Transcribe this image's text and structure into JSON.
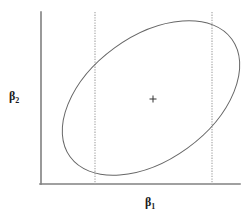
{
  "figure": {
    "title": "",
    "background_color": "#ffffff"
  },
  "axes": {
    "x": {
      "label_symbol": "β",
      "label_subscript": "1",
      "label_text": "β1",
      "line_color": "#808080",
      "pixel_start_x": 41,
      "pixel_end_x": 240,
      "pixel_y": 184
    },
    "y": {
      "label_symbol": "β",
      "label_subscript": "2",
      "label_text": "β2",
      "line_color": "#808080",
      "pixel_x": 41,
      "pixel_start_y": 12,
      "pixel_end_y": 184
    }
  },
  "chart_data": {
    "type": "scatter",
    "title": "",
    "xlabel": "β1",
    "ylabel": "β2",
    "grid": false,
    "legend": null,
    "xlim": [
      41,
      240
    ],
    "ylim": [
      12,
      184
    ],
    "xticks": [],
    "yticks": [],
    "annotations": [],
    "series": [
      {
        "name": "joint-confidence-ellipse",
        "type": "ellipse",
        "stroke_color": "#666666",
        "stroke_width": 1,
        "fill": "none",
        "center_x": 151,
        "center_y": 98,
        "semi_major": 100,
        "semi_minor": 62,
        "rotation_deg": -36,
        "extent_left_x": 72,
        "extent_right_x": 228,
        "extent_top_y": 14,
        "extent_bottom_y": 181
      },
      {
        "name": "center-point-marker",
        "type": "cross-marker",
        "x": 153,
        "y": 99,
        "color": "#333333",
        "size": 7
      },
      {
        "name": "marginal-interval-lower-bound",
        "type": "vline",
        "x": 95,
        "y_top": 12,
        "y_bottom": 184,
        "style": "dotted",
        "color": "#b0b0b0"
      },
      {
        "name": "marginal-interval-upper-bound",
        "type": "vline",
        "x": 212,
        "y_top": 12,
        "y_bottom": 184,
        "style": "dotted",
        "color": "#b0b0b0"
      }
    ]
  }
}
